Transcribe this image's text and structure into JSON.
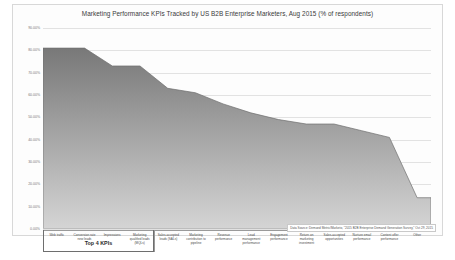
{
  "chart_data": {
    "type": "area",
    "title": "Marketing Performance KPIs Tracked by US B2B Enterprise Marketers, Aug 2015 (% of respondents)",
    "xlabel": "",
    "ylabel": "",
    "ylim": [
      0,
      90
    ],
    "grid": true,
    "legend": "none",
    "categories": [
      "Web traffic",
      "Conversion rate\nnew leads",
      "Impressions",
      "Marketing\nqualified leads\n(MQLs)",
      "Sales-accepted\nleads (SALs)",
      "Marketing\ncontribution to\npipeline",
      "Revenue\nperformance",
      "Lead\nmanagement\nperformance",
      "Engagement\nperformance",
      "Return on\nmarketing\ninvestment",
      "Sales-accepted\nopportunities",
      "Nurture email\nperformance",
      "Content offer\nperformance",
      "Other"
    ],
    "values": [
      81,
      81,
      73,
      73,
      63,
      61,
      56,
      52,
      49,
      47,
      47,
      44,
      41,
      14
    ],
    "ytick_labels": [
      "90.00%",
      "80.00%",
      "70.00%",
      "60.00%",
      "50.00%",
      "40.00%",
      "30.00%",
      "20.00%",
      "10.00%",
      "0.00%"
    ],
    "ytick_values": [
      90,
      80,
      70,
      60,
      50,
      40,
      30,
      20,
      10,
      0
    ],
    "annotation": "Top 4 KPIs",
    "annotation_span": 4,
    "series_color": "#8c8c8c",
    "source": "Data Source: Demand Metric/Marketo, \"2015 B2B Enterprise Demand Generation Survey,\" Oct 29, 2015"
  },
  "footer": {
    "caption": ""
  }
}
